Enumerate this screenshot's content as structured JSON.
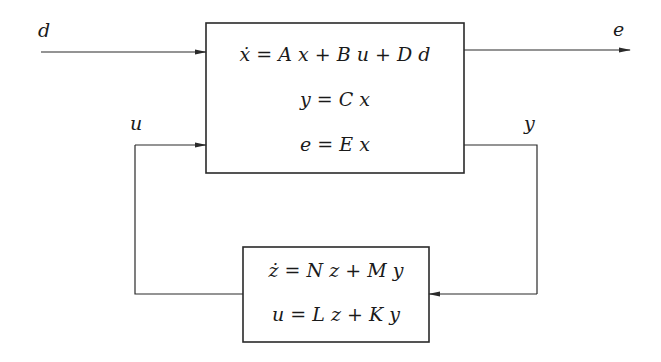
{
  "diagram": {
    "type": "block-diagram",
    "title": "",
    "plant_block": {
      "equations": [
        "ẋ = A x + B u + D d",
        "y = C x",
        "e = E x"
      ]
    },
    "controller_block": {
      "equations": [
        "ż = N z + M y",
        "u = L z + K y"
      ]
    },
    "signals": {
      "disturbance": "d",
      "error_output": "e",
      "control_input": "u",
      "measurement": "y"
    },
    "colors": {
      "stroke": "#2a2a2a",
      "text": "#1a1a1a",
      "background": "#ffffff"
    }
  }
}
